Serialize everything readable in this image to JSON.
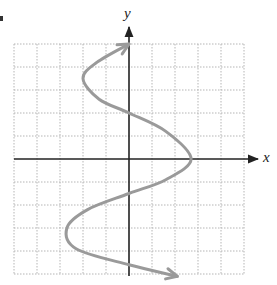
{
  "chart_data": {
    "type": "line",
    "title": "",
    "xlabel": "x",
    "ylabel": "y",
    "xlim": [
      -5,
      5
    ],
    "ylim": [
      -5,
      5
    ],
    "grid": true,
    "grid_style": "dotted",
    "unit_px": 23,
    "origin_px": [
      129,
      159
    ],
    "tick_labels": [],
    "legend": [],
    "series": [
      {
        "name": "curve",
        "color": "#9a9a9a",
        "arrows": "both-ends",
        "points": [
          {
            "x": 0.0,
            "y": 5.0
          },
          {
            "x": -1.4,
            "y": 4.2
          },
          {
            "x": -2.0,
            "y": 3.5
          },
          {
            "x": -1.3,
            "y": 2.6
          },
          {
            "x": 0.0,
            "y": 2.0
          },
          {
            "x": 1.6,
            "y": 1.2
          },
          {
            "x": 2.7,
            "y": 0.0
          },
          {
            "x": 1.6,
            "y": -0.9
          },
          {
            "x": 0.0,
            "y": -1.5
          },
          {
            "x": -1.8,
            "y": -2.2
          },
          {
            "x": -2.7,
            "y": -3.0
          },
          {
            "x": -2.3,
            "y": -3.9
          },
          {
            "x": 0.0,
            "y": -4.6
          },
          {
            "x": 2.1,
            "y": -5.1
          }
        ]
      }
    ]
  },
  "labels": {
    "x_axis": "x",
    "y_axis": "y"
  },
  "colors": {
    "axis": "#222222",
    "grid": "#b5b5b5",
    "curve": "#9a9a9a"
  }
}
